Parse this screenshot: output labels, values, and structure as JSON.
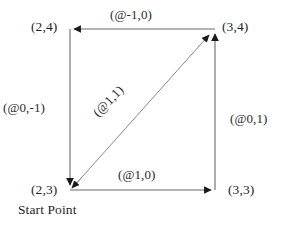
{
  "diagram": {
    "type": "line-art-vector-diagram",
    "stroke_color": "#555555",
    "arrow_color": "#1a1a1a",
    "background_color": "#ffffff",
    "vertices": [
      {
        "id": "top-left",
        "label": "(2,4)"
      },
      {
        "id": "top-right",
        "label": "(3,4)"
      },
      {
        "id": "bottom-left",
        "label": "(2,3)"
      },
      {
        "id": "bottom-right",
        "label": "(3,3)"
      }
    ],
    "edges": [
      {
        "id": "top",
        "label": "(@-1,0)",
        "direction": "left"
      },
      {
        "id": "left",
        "label": "(@0,-1)",
        "direction": "down"
      },
      {
        "id": "right",
        "label": "(@0,1)",
        "direction": "up"
      },
      {
        "id": "bottom",
        "label": "(@1,0)",
        "direction": "right"
      },
      {
        "id": "diagonal",
        "label": "(@1,1)",
        "direction": "up-right"
      }
    ],
    "notes": [
      {
        "id": "start-point",
        "label": "Start Point"
      }
    ]
  }
}
